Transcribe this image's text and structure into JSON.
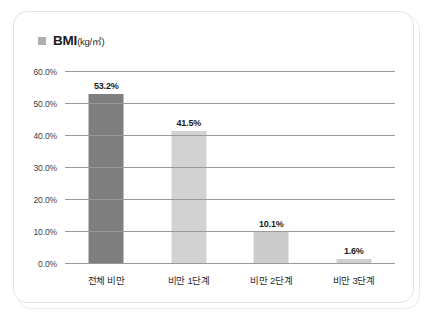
{
  "card": {
    "legend_marker": "square-marker",
    "title": "BMI",
    "unit": "(kg/㎡)"
  },
  "chart_data": {
    "type": "bar",
    "title": "BMI(kg/㎡)",
    "xlabel": "",
    "ylabel": "",
    "ylim": [
      0,
      60
    ],
    "ytick_labels": [
      "0.0%",
      "10.0%",
      "20.0%",
      "30.0%",
      "40.0%",
      "50.0%",
      "60.0%"
    ],
    "ytick_values": [
      0,
      10,
      20,
      30,
      40,
      50,
      60
    ],
    "grid": true,
    "legend_position": "top-left",
    "categories": [
      "전체 비만",
      "비만 1단계",
      "비만 2단계",
      "비만 3단계"
    ],
    "values": [
      53.2,
      41.5,
      10.1,
      1.6
    ],
    "value_labels": [
      "53.2%",
      "41.5%",
      "10.1%",
      "1.6%"
    ],
    "bar_colors": [
      "#7f7f7f",
      "#d2d2d2",
      "#cccccc",
      "#cfcfcf"
    ]
  },
  "colors": {
    "card_border": "#e3e3e3",
    "gridline": "#9a9a9a",
    "legend_swatch": "#b0b0b0",
    "text": "#1c1c1c"
  }
}
